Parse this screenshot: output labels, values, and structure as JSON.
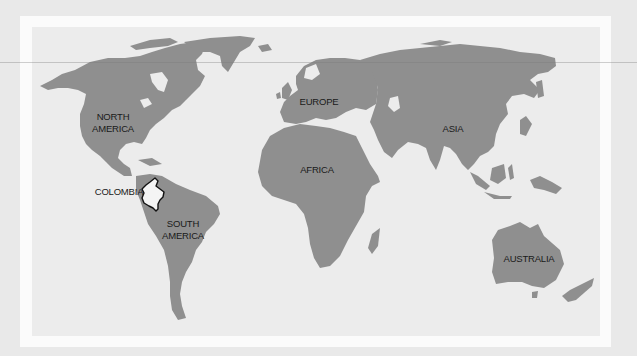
{
  "map": {
    "title": "World map highlighting Colombia",
    "colors": {
      "background": "#e9e9e9",
      "frame": "#fbfbfb",
      "ocean": "#ececec",
      "land": "#8f8f8f",
      "highlight_fill": "#f4f4f4",
      "highlight_outline": "#111111",
      "label_text": "#1a1a1a"
    },
    "labels": {
      "north_america_line1": "NORTH",
      "north_america_line2": "AMERICA",
      "south_america_line1": "SOUTH",
      "south_america_line2": "AMERICA",
      "europe": "EUROPE",
      "africa": "AFRICA",
      "asia": "ASIA",
      "australia": "AUSTRALIA",
      "colombia": "COLOMBIA"
    },
    "highlighted_country": "COLOMBIA"
  }
}
